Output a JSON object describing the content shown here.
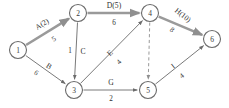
{
  "diagram": {
    "type": "activity-on-arrow-network",
    "title": "",
    "width": 229,
    "height": 108,
    "colors": {
      "background": "#ffffff",
      "node_stroke": "#6b6b6b",
      "edge": "#7a7a7a",
      "critical_path": "#9a9a9a",
      "text": "#2f2f2f"
    },
    "nodes": [
      {
        "id": "1",
        "label": "1",
        "x": 18,
        "y": 50,
        "r": 8.5
      },
      {
        "id": "2",
        "label": "2",
        "x": 78,
        "y": 13,
        "r": 8.5
      },
      {
        "id": "3",
        "label": "3",
        "x": 74,
        "y": 90,
        "r": 8.5
      },
      {
        "id": "4",
        "label": "4",
        "x": 150,
        "y": 13,
        "r": 8.5
      },
      {
        "id": "5",
        "label": "5",
        "x": 148,
        "y": 90,
        "r": 8.5
      },
      {
        "id": "6",
        "label": "6",
        "x": 212,
        "y": 39,
        "r": 8.5
      }
    ],
    "edges": [
      {
        "id": "e-1-2",
        "from": "1",
        "to": "2",
        "name": "A(2)",
        "weight": "5",
        "style": "critical",
        "name_x": 42,
        "name_y": 24,
        "name_rotate": -32,
        "weight_x": 54,
        "weight_y": 39,
        "weight_rotate": -32
      },
      {
        "id": "e-1-3",
        "from": "1",
        "to": "3",
        "name": "B",
        "weight": "6",
        "style": "solid",
        "name_x": 49,
        "name_y": 66,
        "name_rotate": 33,
        "weight_x": 36,
        "weight_y": 73,
        "weight_rotate": 33
      },
      {
        "id": "e-2-3",
        "from": "2",
        "to": "3",
        "name": "C",
        "weight": "1",
        "style": "solid",
        "name_x": 83,
        "name_y": 51,
        "name_rotate": 0,
        "weight_x": 70,
        "weight_y": 51,
        "weight_rotate": 0
      },
      {
        "id": "e-2-4",
        "from": "2",
        "to": "4",
        "name": "D(5)",
        "weight": "6",
        "style": "critical",
        "name_x": 114,
        "name_y": 5,
        "name_rotate": 0,
        "weight_x": 114,
        "weight_y": 23,
        "weight_rotate": 0
      },
      {
        "id": "e-3-4",
        "from": "3",
        "to": "4",
        "name": "E",
        "weight": "4",
        "style": "solid",
        "name_x": 110,
        "name_y": 53,
        "name_rotate": -45,
        "weight_x": 119,
        "weight_y": 62,
        "weight_rotate": -45
      },
      {
        "id": "e-4-5",
        "from": "4",
        "to": "5",
        "name": "",
        "weight": "",
        "style": "dummy",
        "name_x": 0,
        "name_y": 0,
        "name_rotate": 0,
        "weight_x": 0,
        "weight_y": 0,
        "weight_rotate": 0
      },
      {
        "id": "e-3-5",
        "from": "3",
        "to": "5",
        "name": "G",
        "weight": "2",
        "style": "solid",
        "name_x": 111,
        "name_y": 82,
        "name_rotate": 0,
        "weight_x": 111,
        "weight_y": 99,
        "weight_rotate": 0
      },
      {
        "id": "e-4-6",
        "from": "4",
        "to": "6",
        "name": "H(10)",
        "weight": "8",
        "style": "critical",
        "name_x": 183,
        "name_y": 15,
        "name_rotate": 38,
        "weight_x": 172,
        "weight_y": 30,
        "weight_rotate": 38
      },
      {
        "id": "e-5-6",
        "from": "5",
        "to": "6",
        "name": "I",
        "weight": "4",
        "style": "solid",
        "name_x": 173,
        "name_y": 66,
        "name_rotate": -38,
        "weight_x": 182,
        "weight_y": 76,
        "weight_rotate": -38
      }
    ]
  }
}
